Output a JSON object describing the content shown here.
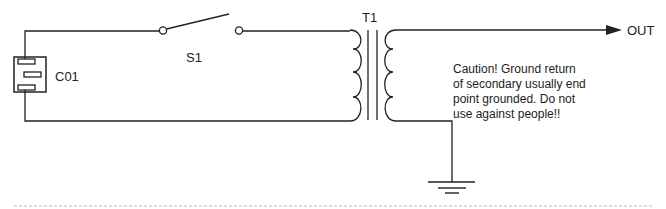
{
  "diagram": {
    "type": "circuit-schematic",
    "line_color": "#222222",
    "divider_color": "#bbbbbb",
    "components": {
      "connector": {
        "label": "C01"
      },
      "switch": {
        "label": "S1"
      },
      "transformer": {
        "label": "T1"
      },
      "output": {
        "label": "OUT"
      }
    },
    "caution_note": {
      "lines": [
        "Caution! Ground return",
        "of secondary usually end",
        "point grounded. Do not",
        "use against people!!"
      ]
    }
  }
}
